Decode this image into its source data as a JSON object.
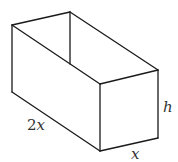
{
  "figure": {
    "labels": {
      "length_coef": "2",
      "length_var": "x",
      "width": "x",
      "height": "h"
    }
  },
  "colors": {
    "stroke": "#1a1a1a",
    "label": "#333333",
    "background": "#ffffff"
  }
}
